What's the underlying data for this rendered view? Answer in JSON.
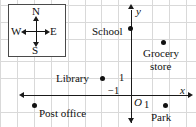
{
  "figure": {
    "type": "coordinate-map",
    "background": "#ffffff",
    "grid_color": "#d9d9d9",
    "axis_color": "#1a1a1a",
    "point_color": "#111111",
    "width": 196,
    "height": 127
  },
  "compass": {
    "name": "compass-rose",
    "north": "N",
    "south": "S",
    "east": "E",
    "west": "W",
    "border_color": "#4a4a4a"
  },
  "axes": {
    "x_label": "x",
    "y_label": "y",
    "origin_label": "O",
    "x_tick_pos_label": "1",
    "x_tick_neg_label": "−1",
    "y_tick_pos_label": "1",
    "origin": {
      "px": 135,
      "py": 95
    },
    "unit_px": 17.2
  },
  "places": [
    {
      "name": "School",
      "label": "School",
      "coord": [
        0,
        4
      ],
      "px": 130,
      "py": 28,
      "label_x": 92,
      "label_y": 24
    },
    {
      "name": "Grocery store",
      "label": "Grocery",
      "label2": "store",
      "coord": [
        2,
        3
      ],
      "px": 163,
      "py": 42,
      "label_x": 143,
      "label_y": 47,
      "label2_x": 150,
      "label2_y": 60
    },
    {
      "name": "Library",
      "label": "Library",
      "coord": [
        -2,
        1
      ],
      "px": 102,
      "py": 78,
      "label_x": 58,
      "label_y": 74
    },
    {
      "name": "Post office",
      "label": "Post office",
      "coord": [
        -6,
        -1
      ],
      "px": 34,
      "py": 105,
      "label_x": 40,
      "label_y": 108
    },
    {
      "name": "Park",
      "label": "Park",
      "coord": [
        2,
        -1
      ],
      "px": 165,
      "py": 105,
      "label_x": 152,
      "label_y": 112
    }
  ],
  "grid": {
    "v_lines": [
      0,
      17,
      34,
      51,
      68,
      85,
      101,
      118,
      135,
      152,
      169,
      186
    ],
    "h_lines": [
      5,
      22,
      39,
      56,
      61,
      78,
      95,
      112
    ]
  }
}
